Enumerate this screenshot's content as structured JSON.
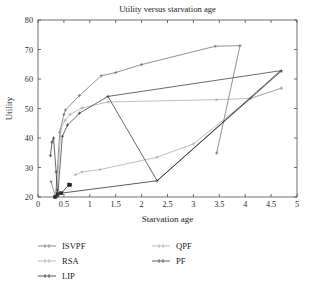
{
  "chart_data": {
    "type": "line",
    "title": "Utility versus starvation age",
    "xlabel": "Starvation age",
    "ylabel": "Utility",
    "xlim": [
      0,
      5
    ],
    "ylim": [
      20,
      80
    ],
    "xticks": [
      "0",
      "0.5",
      "1",
      "1.5",
      "2",
      "2.5",
      "3",
      "3.5",
      "4",
      "4.5",
      "5"
    ],
    "xtick_values": [
      0,
      0.5,
      1,
      1.5,
      2,
      2.5,
      3,
      3.5,
      4,
      4.5,
      5
    ],
    "yticks": [
      "20",
      "30",
      "40",
      "50",
      "60",
      "70",
      "80"
    ],
    "ytick_values": [
      20,
      30,
      40,
      50,
      60,
      70,
      80
    ],
    "grid": false,
    "legend_position": "below-plot",
    "series": [
      {
        "name": "ISVPF",
        "color": "#6e6e6e",
        "marker": "plus",
        "points": [
          [
            0.25,
            25.2
          ],
          [
            0.34,
            20.0
          ],
          [
            0.42,
            42.0
          ],
          [
            0.5,
            48.0
          ],
          [
            0.53,
            49.5
          ],
          [
            0.8,
            54.4
          ],
          [
            1.22,
            61.1
          ],
          [
            1.5,
            62.2
          ],
          [
            2.0,
            64.9
          ],
          [
            3.42,
            71.1
          ],
          [
            3.9,
            71.3
          ],
          [
            3.45,
            34.9
          ]
        ]
      },
      {
        "name": "RSA",
        "color": "#a8a8a8",
        "marker": "star",
        "points": [
          [
            0.36,
            20.0
          ],
          [
            0.44,
            43.0
          ],
          [
            0.52,
            46.0
          ],
          [
            0.62,
            48.0
          ],
          [
            0.85,
            50.2
          ],
          [
            1.35,
            52.2
          ],
          [
            3.45,
            53.0
          ],
          [
            4.1,
            53.4
          ],
          [
            4.7,
            56.9
          ]
        ]
      },
      {
        "name": "LIP",
        "color": "#262626",
        "marker": "square",
        "points": [
          [
            0.33,
            20.0
          ],
          [
            0.38,
            21.0
          ],
          [
            0.45,
            21.3
          ],
          [
            0.6,
            24.2
          ],
          [
            0.62,
            24.1
          ]
        ]
      },
      {
        "name": "QPF",
        "color": "#a8a8a8",
        "marker": "plus",
        "points": [
          [
            0.72,
            27.5
          ],
          [
            0.85,
            28.5
          ],
          [
            1.2,
            29.3
          ],
          [
            2.3,
            33.5
          ],
          [
            3.0,
            38.0
          ],
          [
            4.1,
            53.4
          ],
          [
            4.7,
            56.9
          ]
        ]
      },
      {
        "name": "PF",
        "color": "#3a3a3a",
        "marker": "plus",
        "points": [
          [
            0.24,
            34.0
          ],
          [
            0.27,
            38.6
          ],
          [
            0.3,
            40.0
          ],
          [
            0.35,
            28.5
          ],
          [
            0.37,
            22.4
          ],
          [
            0.38,
            20.2
          ],
          [
            0.47,
            40.6
          ],
          [
            0.57,
            44.4
          ],
          [
            0.8,
            48.4
          ],
          [
            1.35,
            54.1
          ],
          [
            2.3,
            25.5
          ],
          [
            4.7,
            62.7
          ]
        ]
      }
    ],
    "extra_paths": [
      {
        "name": "PF-upper-branch",
        "color": "#3a3a3a",
        "points": [
          [
            1.35,
            54.1
          ],
          [
            4.68,
            62.8
          ]
        ]
      },
      {
        "name": "LIP-lower-branch",
        "color": "#262626",
        "points": [
          [
            0.45,
            21.3
          ],
          [
            2.3,
            25.5
          ],
          [
            4.68,
            62.8
          ]
        ]
      }
    ]
  },
  "legend": {
    "entries": [
      {
        "label": "ISVPF",
        "color": "#6e6e6e"
      },
      {
        "label": "QPF",
        "color": "#a8a8a8"
      },
      {
        "label": "RSA",
        "color": "#a8a8a8"
      },
      {
        "label": "PF",
        "color": "#3a3a3a"
      },
      {
        "label": "LIP",
        "color": "#262626"
      }
    ]
  }
}
